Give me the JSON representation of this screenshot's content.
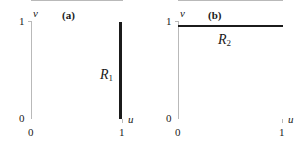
{
  "figure": {
    "background_color": "#ffffff",
    "ink_color": "#1a1a1a",
    "axis_color": "#b9b9b9",
    "segment_color": "#1b1b1b"
  },
  "panels": [
    {
      "caption": "(a)",
      "axis_x_name": "u",
      "axis_y_name": "v",
      "x_tick_min": "0",
      "x_tick_max": "1",
      "y_tick_min": "0",
      "y_tick_max": "1",
      "region_symbol": "R",
      "region_subscript": "1",
      "region_orientation": "vertical"
    },
    {
      "caption": "(b)",
      "axis_x_name": "u",
      "axis_y_name": "v",
      "x_tick_min": "0",
      "x_tick_max": "1",
      "y_tick_min": "0",
      "y_tick_max": "1",
      "region_symbol": "R",
      "region_subscript": "2",
      "region_orientation": "horizontal"
    }
  ],
  "chart_data": {
    "type": "line",
    "title": "",
    "xlabel": "u",
    "ylabel": "v",
    "xlim": [
      0,
      1
    ],
    "ylim": [
      0,
      1
    ],
    "grid": false,
    "legend": "none",
    "subplots": [
      {
        "label": "(a)",
        "xlabel": "u",
        "ylabel": "v",
        "xlim": [
          0,
          1
        ],
        "ylim": [
          0,
          1
        ],
        "xticks": [
          0,
          1
        ],
        "xticklabels": [
          "0",
          "1"
        ],
        "yticks": [
          0,
          1
        ],
        "yticklabels": [
          "0",
          "1"
        ],
        "series": [
          {
            "name": "R1",
            "annotation": "R₁",
            "orientation": "vertical",
            "x": [
              1,
              1
            ],
            "y": [
              0,
              1
            ],
            "linewidth": 3,
            "color": "#1b1b1b"
          }
        ]
      },
      {
        "label": "(b)",
        "xlabel": "u",
        "ylabel": "v",
        "xlim": [
          0,
          1
        ],
        "ylim": [
          0,
          1
        ],
        "xticks": [
          0,
          1
        ],
        "xticklabels": [
          "0",
          "1"
        ],
        "yticks": [
          0,
          1
        ],
        "yticklabels": [
          "0",
          "1"
        ],
        "series": [
          {
            "name": "R2",
            "annotation": "R₂",
            "orientation": "horizontal",
            "x": [
              0,
              1
            ],
            "y": [
              1,
              1
            ],
            "linewidth": 2,
            "color": "#1b1b1b"
          }
        ]
      }
    ]
  }
}
